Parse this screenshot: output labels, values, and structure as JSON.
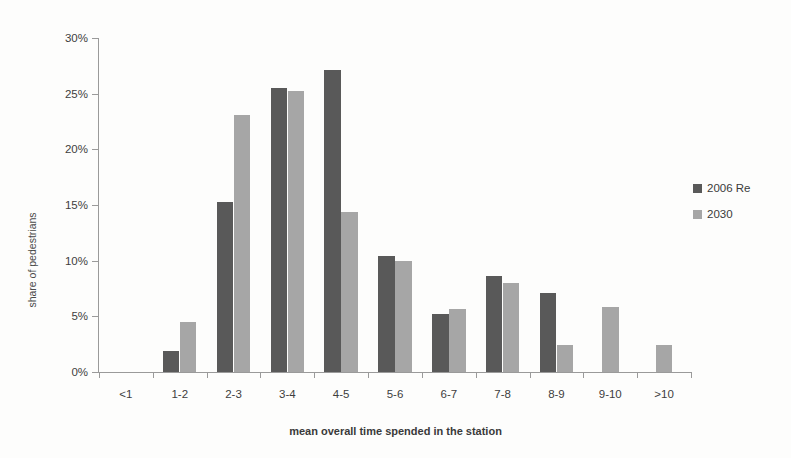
{
  "chart_data": {
    "type": "bar",
    "title": "",
    "xlabel": "mean overall time spended in the station",
    "ylabel": "share of pedestrians",
    "categories": [
      "<1",
      "1-2",
      "2-3",
      "3-4",
      "4-5",
      "5-6",
      "6-7",
      "7-8",
      "8-9",
      "9-10",
      ">10"
    ],
    "series": [
      {
        "name": "2006 Re",
        "color": "#595959",
        "values": [
          0,
          1.9,
          15.3,
          25.5,
          27.1,
          10.4,
          5.2,
          8.6,
          7.1,
          0,
          0
        ]
      },
      {
        "name": "2030",
        "color": "#a6a6a6",
        "values": [
          0,
          4.5,
          23.1,
          25.2,
          14.4,
          10.0,
          5.7,
          8.0,
          2.4,
          5.8,
          2.4
        ]
      }
    ],
    "ylim": [
      0,
      30
    ],
    "ytick_values": [
      0,
      5,
      10,
      15,
      20,
      25,
      30
    ],
    "ytick_labels": [
      "0%",
      "5%",
      "10%",
      "15%",
      "20%",
      "25%",
      "30%"
    ],
    "grid": false,
    "legend_position": "right"
  },
  "legend": {
    "items": [
      {
        "label": "2006 Re",
        "swatch": "dark"
      },
      {
        "label": "2030",
        "swatch": "light"
      }
    ]
  },
  "axes": {
    "x_title": "mean overall time spended in the station",
    "y_title": "share of pedestrians"
  }
}
